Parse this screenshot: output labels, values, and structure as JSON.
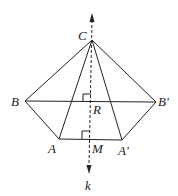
{
  "diagram": {
    "type": "geometry",
    "line_color": "#222222",
    "points": {
      "C": {
        "label": "C",
        "x": 92,
        "y": 40
      },
      "B": {
        "label": "B",
        "x": 25,
        "y": 101
      },
      "Bp": {
        "label": "B'",
        "x": 156,
        "y": 102
      },
      "A": {
        "label": "A",
        "x": 59,
        "y": 139
      },
      "Ap": {
        "label": "A'",
        "x": 122,
        "y": 140
      },
      "R": {
        "label": "R",
        "x": 91,
        "y": 102
      },
      "M": {
        "label": "M",
        "x": 90,
        "y": 139
      }
    },
    "axis": {
      "label": "k"
    },
    "segments": [
      "CB",
      "CB'",
      "CA",
      "CA'",
      "BB'",
      "BA",
      "AA'",
      "A'B'"
    ],
    "right_angles": [
      "R",
      "M"
    ]
  }
}
